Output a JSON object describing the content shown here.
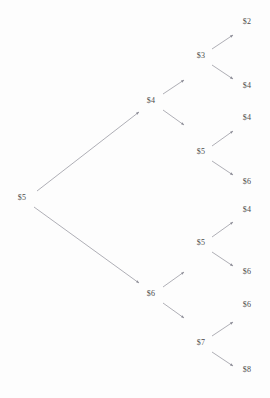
{
  "figure": {
    "type": "binomial-tree-diagram",
    "title": "",
    "background_color": "#fdfdfd",
    "label_color": "#4a4a4a",
    "edge_color": "#8c8c96",
    "width": 270,
    "height": 398
  },
  "chart_data": {
    "type": "diagram",
    "title": "",
    "xlabel": "",
    "ylabel": "",
    "structure": "binary recombining-style price tree, 4 levels, 15 nodes",
    "levels": [
      {
        "level": 0,
        "nodes": [
          {
            "id": "n0",
            "label": "$5",
            "value": 5,
            "x": 22,
            "y": 198
          }
        ]
      },
      {
        "level": 1,
        "nodes": [
          {
            "id": "n1u",
            "label": "$4",
            "value": 4,
            "x": 151,
            "y": 101
          },
          {
            "id": "n1d",
            "label": "$6",
            "value": 6,
            "x": 151,
            "y": 294
          }
        ]
      },
      {
        "level": 2,
        "nodes": [
          {
            "id": "n2a",
            "label": "$3",
            "value": 3,
            "x": 201,
            "y": 56
          },
          {
            "id": "n2b",
            "label": "$5",
            "value": 5,
            "x": 201,
            "y": 152
          },
          {
            "id": "n2c",
            "label": "$5",
            "value": 5,
            "x": 201,
            "y": 243
          },
          {
            "id": "n2d",
            "label": "$7",
            "value": 7,
            "x": 201,
            "y": 343
          }
        ]
      },
      {
        "level": 3,
        "nodes": [
          {
            "id": "l1",
            "label": "$2",
            "value": 2,
            "x": 247,
            "y": 22
          },
          {
            "id": "l2",
            "label": "$4",
            "value": 4,
            "x": 247,
            "y": 86
          },
          {
            "id": "l3",
            "label": "$4",
            "value": 4,
            "x": 247,
            "y": 118
          },
          {
            "id": "l4",
            "label": "$6",
            "value": 6,
            "x": 247,
            "y": 182
          },
          {
            "id": "l5",
            "label": "$4",
            "value": 4,
            "x": 247,
            "y": 210
          },
          {
            "id": "l6",
            "label": "$6",
            "value": 6,
            "x": 247,
            "y": 272
          },
          {
            "id": "l7",
            "label": "$6",
            "value": 6,
            "x": 247,
            "y": 305
          },
          {
            "id": "l8",
            "label": "$8",
            "value": 8,
            "x": 247,
            "y": 370
          }
        ]
      }
    ],
    "edges": [
      {
        "from": "n0",
        "to": "n1u",
        "x1": 37,
        "y1": 191,
        "x2": 139,
        "y2": 112,
        "direction": "up"
      },
      {
        "from": "n0",
        "to": "n1d",
        "x1": 34,
        "y1": 207,
        "x2": 139,
        "y2": 283,
        "direction": "down"
      },
      {
        "from": "n1u",
        "to": "n2a",
        "x1": 163,
        "y1": 94,
        "x2": 184,
        "y2": 80,
        "direction": "up"
      },
      {
        "from": "n1u",
        "to": "n2b",
        "x1": 163,
        "y1": 110,
        "x2": 184,
        "y2": 125,
        "direction": "down"
      },
      {
        "from": "n1d",
        "to": "n2c",
        "x1": 163,
        "y1": 287,
        "x2": 184,
        "y2": 272,
        "direction": "up"
      },
      {
        "from": "n1d",
        "to": "n2d",
        "x1": 163,
        "y1": 303,
        "x2": 184,
        "y2": 318,
        "direction": "down"
      },
      {
        "from": "n2a",
        "to": "l1",
        "x1": 212,
        "y1": 49,
        "x2": 233,
        "y2": 35,
        "direction": "up"
      },
      {
        "from": "n2a",
        "to": "l2",
        "x1": 212,
        "y1": 65,
        "x2": 233,
        "y2": 79,
        "direction": "down"
      },
      {
        "from": "n2b",
        "to": "l3",
        "x1": 212,
        "y1": 146,
        "x2": 233,
        "y2": 131,
        "direction": "up"
      },
      {
        "from": "n2b",
        "to": "l4",
        "x1": 212,
        "y1": 161,
        "x2": 233,
        "y2": 175,
        "direction": "down"
      },
      {
        "from": "n2c",
        "to": "l5",
        "x1": 212,
        "y1": 237,
        "x2": 233,
        "y2": 222,
        "direction": "up"
      },
      {
        "from": "n2c",
        "to": "l6",
        "x1": 212,
        "y1": 252,
        "x2": 233,
        "y2": 266,
        "direction": "down"
      },
      {
        "from": "n2d",
        "to": "l7",
        "x1": 212,
        "y1": 336,
        "x2": 233,
        "y2": 322,
        "direction": "up"
      },
      {
        "from": "n2d",
        "to": "l8",
        "x1": 212,
        "y1": 352,
        "x2": 233,
        "y2": 366,
        "direction": "down"
      }
    ],
    "all_labels": [
      "$5",
      "$4",
      "$6",
      "$3",
      "$5",
      "$5",
      "$7",
      "$2",
      "$4",
      "$4",
      "$6",
      "$4",
      "$6",
      "$6",
      "$8"
    ]
  }
}
